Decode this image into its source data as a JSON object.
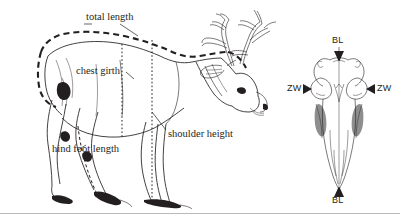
{
  "figure": {
    "background_color": "#ffffff",
    "ink_color": "#231f20",
    "border_color": "#b9b9b9"
  },
  "body_diagram": {
    "subject": "red deer stag, left lateral view",
    "labels": [
      {
        "id": "total-length",
        "text": "total length",
        "x": 86,
        "y": 18,
        "measure_style": "dashed-outline"
      },
      {
        "id": "chest-girth",
        "text": "chest girth",
        "x": 76,
        "y": 72,
        "measure_style": "dotted-vertical"
      },
      {
        "id": "hind-foot-length",
        "text": "hind foot length",
        "x": 52,
        "y": 150,
        "measure_style": "dashed-segment"
      },
      {
        "id": "shoulder-height",
        "text": "shoulder height",
        "x": 168,
        "y": 135,
        "measure_style": "dotted-vertical"
      }
    ]
  },
  "skull_diagram": {
    "subject": "deer skull, dorsal view",
    "labels": [
      {
        "id": "skull-bl-top",
        "text": "BL",
        "x": 339,
        "y": 38,
        "arrow": "down"
      },
      {
        "id": "skull-bl-bottom",
        "text": "BL",
        "x": 339,
        "y": 196,
        "arrow": "up"
      },
      {
        "id": "skull-zw-left",
        "text": "ZW",
        "x": 288,
        "y": 84,
        "arrow": "right"
      },
      {
        "id": "skull-zw-right",
        "text": "ZW",
        "x": 377,
        "y": 84,
        "arrow": "left"
      }
    ],
    "abbreviations": {
      "BL": "basal length",
      "ZW": "zygomatic width"
    }
  }
}
